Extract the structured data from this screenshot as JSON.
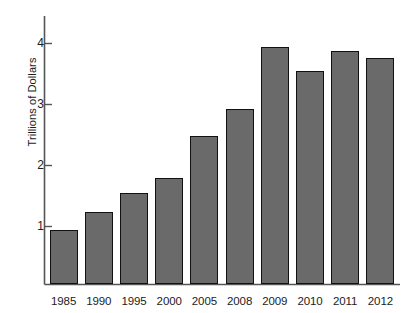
{
  "chart_data": {
    "type": "bar",
    "title": "",
    "subtitle": "",
    "xlabel": "",
    "ylabel": "Trillions of Dollars",
    "categories": [
      "1985",
      "1990",
      "1995",
      "2000",
      "2005",
      "2008",
      "2009",
      "2010",
      "2011",
      "2012"
    ],
    "values": [
      0.95,
      1.24,
      1.55,
      1.8,
      2.48,
      2.92,
      3.95,
      3.55,
      3.87,
      3.77
    ],
    "ylim": [
      0.3,
      4.25
    ],
    "yticks": [
      1,
      2,
      3,
      4
    ],
    "ytick_labels": [
      "1",
      "2",
      "3",
      "4"
    ],
    "grid": false,
    "legend": false,
    "legend_position": "none",
    "bar_fill_color": "#6a6a6a",
    "bar_edge_color": "#111111",
    "axis_color": "#555555",
    "background_color": "#ffffff",
    "annotations": []
  }
}
